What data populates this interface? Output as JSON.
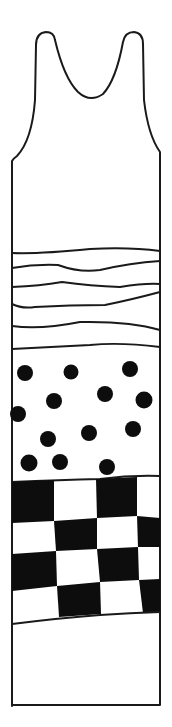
{
  "illustration": {
    "subject": "Long sleeveless tank dress line drawing",
    "colors": {
      "ink": "#111111",
      "background": "#ffffff"
    },
    "sections": [
      {
        "name": "plain-bodice"
      },
      {
        "name": "wavy-stripes",
        "count": 6
      },
      {
        "name": "polka-dots",
        "count": 13
      },
      {
        "name": "checkerboard",
        "rows": 4,
        "cols": 4
      },
      {
        "name": "plain-hem"
      }
    ]
  }
}
